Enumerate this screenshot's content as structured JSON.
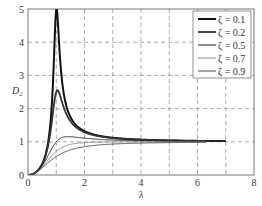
{
  "chart_data": {
    "type": "line",
    "title": "",
    "xlabel": "λ",
    "ylabel": "D₂",
    "xlim": [
      0,
      8
    ],
    "ylim": [
      0,
      5
    ],
    "xticks": [
      "0",
      "2",
      "4",
      "6",
      "8"
    ],
    "yticks": [
      "0",
      "1",
      "2",
      "3",
      "4",
      "5"
    ],
    "grid": true,
    "legend_position": "upper right",
    "formula": "D2 = λ² / sqrt((1-λ²)² + (2ζλ)²)",
    "x": [
      0,
      0.2,
      0.4,
      0.6,
      0.8,
      0.9,
      1.0,
      1.1,
      1.2,
      1.4,
      1.6,
      2.0,
      2.5,
      3.0,
      4.0,
      5.0,
      6.3,
      7.0
    ],
    "series": [
      {
        "name": "ζ = 0.1",
        "zeta": 0.1,
        "x_end": 7.0,
        "color": "#111111",
        "width": 2.0,
        "values": [
          0,
          0.042,
          0.189,
          0.556,
          1.71,
          3.18,
          5.0,
          2.87,
          1.54,
          1.98,
          1.62,
          1.33,
          1.19,
          1.12,
          1.07,
          1.04,
          1.03,
          1.02
        ]
      },
      {
        "name": "ζ = 0.2",
        "zeta": 0.2,
        "x_end": 7.0,
        "color": "#333333",
        "width": 1.8,
        "values": [
          0,
          0.042,
          0.186,
          0.53,
          1.36,
          1.92,
          2.5,
          2.02,
          1.54,
          1.55,
          1.38,
          1.26,
          1.17,
          1.11,
          1.06,
          1.04,
          1.02,
          1.02
        ]
      },
      {
        "name": "ζ = 0.5",
        "zeta": 0.5,
        "x_end": 7.0,
        "color": "#222222",
        "width": 1.0,
        "values": [
          0,
          0.04,
          0.166,
          0.379,
          0.625,
          0.728,
          1.0,
          1.06,
          1.08,
          1.12,
          1.1,
          1.07,
          1.05,
          1.03,
          1.02,
          1.01,
          1.01,
          1.01
        ]
      },
      {
        "name": "ζ = 0.7",
        "zeta": 0.7,
        "x_end": 6.3,
        "color": "#888888",
        "width": 1.0,
        "values": [
          0,
          0.039,
          0.15,
          0.309,
          0.474,
          0.556,
          0.714,
          0.76,
          0.81,
          0.88,
          0.92,
          0.97,
          0.99,
          1.0,
          1.0,
          1.0,
          1.0,
          1.0
        ]
      },
      {
        "name": "ζ = 0.9",
        "zeta": 0.9,
        "x_end": 6.3,
        "color": "#444444",
        "width": 1.0,
        "values": [
          0,
          0.038,
          0.135,
          0.258,
          0.378,
          0.44,
          0.556,
          0.62,
          0.67,
          0.76,
          0.82,
          0.9,
          0.94,
          0.96,
          0.98,
          0.99,
          0.99,
          0.99
        ]
      }
    ]
  }
}
